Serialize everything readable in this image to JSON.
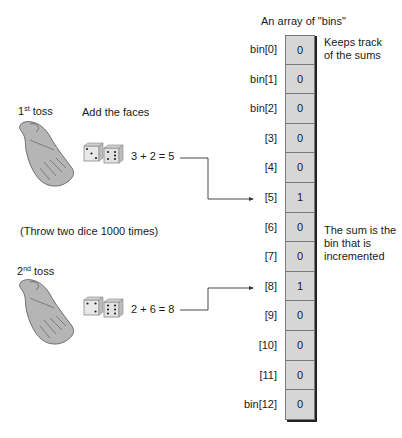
{
  "diagram": {
    "array_title": "An array of \"bins\"",
    "notes": {
      "keeps_track": [
        "Keeps track",
        "of the sums"
      ],
      "sum_is_bin": [
        "The sum is the",
        "bin that is",
        "incremented"
      ]
    },
    "tosses": [
      {
        "label_num": "1",
        "label_sup": "st",
        "label_word": "toss",
        "caption": "Add the faces",
        "dice": [
          3,
          2
        ],
        "equation": "3 + 2 = 5",
        "target_bin": 5
      },
      {
        "label_num": "2",
        "label_sup": "nd",
        "label_word": "toss",
        "caption": "",
        "dice": [
          2,
          6
        ],
        "equation": "2 + 6 = 8",
        "target_bin": 8
      }
    ],
    "throw_note": "(Throw two dice 1000 times)",
    "bins": [
      {
        "label": "bin[0]",
        "value": "0"
      },
      {
        "label": "bin[1]",
        "value": "0"
      },
      {
        "label": "bin[2]",
        "value": "0"
      },
      {
        "label": "[3]",
        "value": "0"
      },
      {
        "label": "[4]",
        "value": "0"
      },
      {
        "label": "[5]",
        "value": "1"
      },
      {
        "label": "[6]",
        "value": "0"
      },
      {
        "label": "[7]",
        "value": "0"
      },
      {
        "label": "[8]",
        "value": "1"
      },
      {
        "label": "[9]",
        "value": "0"
      },
      {
        "label": "[10]",
        "value": "0"
      },
      {
        "label": "[11]",
        "value": "0"
      },
      {
        "label": "bin[12]",
        "value": "0"
      }
    ],
    "colors": {
      "bin_fill": "#d6d6d6",
      "hand_fill": "#b5b5b5",
      "line": "#333333"
    }
  }
}
